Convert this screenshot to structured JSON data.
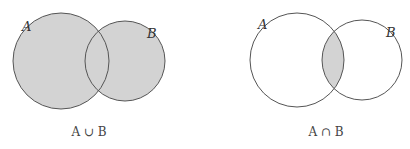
{
  "diagrams": [
    {
      "operation": "union",
      "caption": "A ∪ B",
      "set_a_label": "A",
      "set_b_label": "B",
      "shaded_region": "A union B"
    },
    {
      "operation": "intersection",
      "caption": "A ∩ B",
      "set_a_label": "A",
      "set_b_label": "B",
      "shaded_region": "A intersect B"
    }
  ],
  "colors": {
    "shade": "#d3d3d3",
    "stroke": "#555555",
    "background": "#ffffff"
  }
}
